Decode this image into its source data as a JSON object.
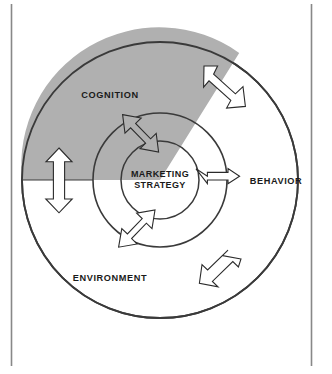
{
  "figure": {
    "kind": "concentric-circle-diagram"
  },
  "colors": {
    "page_background": "#ffffff",
    "ring_outline": "#3a3a3a",
    "cognition_fill": "#b0b0b0",
    "environment_fill": "#ffffff",
    "middle_ring_fill": "#ffffff",
    "core_fill": "#b0b0b0",
    "arrow_white_fill": "#ffffff",
    "arrow_gray_fill": "#b0b0b0",
    "arrow_outline": "#2b2b2b",
    "label_text": "#1a1a1a",
    "frame_rule": "#888888"
  },
  "geometry": {
    "center_x": 160,
    "center_y": 180,
    "outer_radius": 138,
    "middle_radius": 67,
    "core_radius": 39,
    "frame_left_x": 11,
    "frame_right_x": 311,
    "frame_top_y": 4,
    "frame_bottom_y": 366
  },
  "labels": {
    "cognition": "COGNITION",
    "behavior": "BEHAVIOR",
    "environment": "ENVIRONMENT",
    "core_line_1": "MARKETING",
    "core_line_2": "STRATEGY"
  },
  "rings": [
    {
      "name": "outer-ring-cognition-sector",
      "label": "COGNITION",
      "fill": "#b0b0b0",
      "description": "Upper-left shaded sector of the outer ring"
    },
    {
      "name": "outer-ring-environment-sector",
      "label": "ENVIRONMENT",
      "fill": "#ffffff",
      "description": "Remaining unshaded portion of the outer ring"
    },
    {
      "name": "outer-ring-behavior-region",
      "label": "BEHAVIOR",
      "fill": "#ffffff",
      "description": "Right side of the outer ring, labelled outside the middle circle"
    },
    {
      "name": "middle-ring",
      "label": "",
      "fill": "#ffffff",
      "description": "Unlabelled white annulus between outer circle and core"
    },
    {
      "name": "core-circle",
      "label": "MARKETING STRATEGY",
      "fill": "#b0b0b0",
      "description": "Shaded central disc"
    }
  ],
  "arrows": [
    {
      "name": "arrow-cognition-to-behavior",
      "kind": "double-headed",
      "orientation": "diagonal-nw-se",
      "fill": "#ffffff",
      "location": "upper-right, crossing outer ring boundary"
    },
    {
      "name": "arrow-cognition-to-environment",
      "kind": "double-headed",
      "orientation": "vertical",
      "fill": "#ffffff",
      "location": "left, crossing the cognition / environment divide"
    },
    {
      "name": "arrow-cognition-to-core",
      "kind": "double-headed",
      "orientation": "diagonal-nw-se",
      "fill": "#b0b0b0",
      "location": "upper-left, middle ring into core"
    },
    {
      "name": "arrow-core-to-behavior",
      "kind": "double-headed",
      "orientation": "horizontal",
      "fill": "#ffffff",
      "location": "right of core, crossing middle ring"
    },
    {
      "name": "arrow-core-to-environment",
      "kind": "double-headed",
      "orientation": "diagonal-ne-sw",
      "fill": "#ffffff",
      "location": "lower-left, core into middle ring"
    },
    {
      "name": "arrow-environment-to-behavior",
      "kind": "double-headed",
      "orientation": "diagonal-ne-sw",
      "fill": "#ffffff",
      "location": "lower-right, crossing outer ring boundary"
    }
  ]
}
